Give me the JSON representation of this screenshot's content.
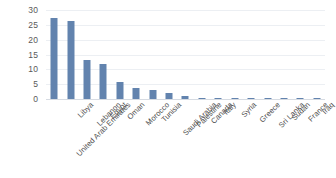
{
  "chart_data": {
    "type": "bar",
    "title": "",
    "subtitle": "",
    "xlabel": "",
    "ylabel": "",
    "ylim": [
      0,
      30
    ],
    "yticks": [
      0,
      5,
      10,
      15,
      20,
      25,
      30
    ],
    "ytick_labels": [
      "0",
      "5",
      "10",
      "15",
      "20",
      "25",
      "30"
    ],
    "grid": true,
    "grid_axis": "y",
    "legend": false,
    "legend_position": "none",
    "bar_color": "#6283ae",
    "gridline_color": "#eceff3",
    "axis_line_color": "#d6dbe2",
    "tick_label_color": "#595959",
    "category_label_color": "#4d4d4d",
    "category_label_rotation": -45,
    "categories": [
      "United Arab Emirates",
      "Libya",
      "Lebanon",
      "Egypt",
      "Oman",
      "Morocco",
      "Tunisia",
      "Saudi Arabia",
      "Palestine",
      "Canada",
      "Italy",
      "Syria",
      "Greece",
      "Sri Lanka",
      "Sudan",
      "France",
      "Iraq"
    ],
    "values": [
      27.2,
      26.4,
      13.0,
      11.8,
      5.9,
      3.7,
      3.1,
      1.9,
      1.0,
      0.5,
      0.4,
      0.35,
      0.3,
      0.25,
      0.2,
      0.2,
      0.15
    ]
  }
}
